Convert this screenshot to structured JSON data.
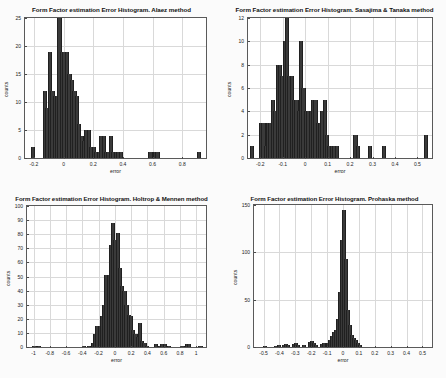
{
  "figure": {
    "background": "#fbfbfb",
    "bar_color": "#3a3a3a",
    "grid_color": "#d9d9d9",
    "axis_color": "#5a5a5a"
  },
  "chart_data": [
    {
      "type": "bar",
      "id": "alaez",
      "title": "Form Factor estimation Error Histogram. Alaez method",
      "xlabel": "error",
      "ylabel": "counts",
      "xlim": [
        -0.26,
        0.96
      ],
      "ylim": [
        0,
        25
      ],
      "xticks": [
        -0.2,
        0,
        0.2,
        0.4,
        0.6,
        0.8
      ],
      "xticklabels": [
        "-0.2",
        "0",
        "0.2",
        "0.4",
        "0.6",
        "0.8"
      ],
      "yticks": [
        0,
        5,
        10,
        15,
        20,
        25
      ],
      "yticklabels": [
        "0",
        "5",
        "10",
        "15",
        "20",
        "25"
      ],
      "grid": true,
      "bin_width": 0.0165,
      "bins": [
        {
          "x": -0.214,
          "v": 2
        },
        {
          "x": -0.131,
          "v": 12
        },
        {
          "x": -0.115,
          "v": 9
        },
        {
          "x": -0.098,
          "v": 19
        },
        {
          "x": -0.082,
          "v": 12
        },
        {
          "x": -0.065,
          "v": 11
        },
        {
          "x": -0.049,
          "v": 11
        },
        {
          "x": -0.033,
          "v": 25
        },
        {
          "x": -0.016,
          "v": 19
        },
        {
          "x": 0.0,
          "v": 19
        },
        {
          "x": 0.017,
          "v": 19
        },
        {
          "x": 0.033,
          "v": 15
        },
        {
          "x": 0.05,
          "v": 14
        },
        {
          "x": 0.066,
          "v": 12
        },
        {
          "x": 0.083,
          "v": 11
        },
        {
          "x": 0.099,
          "v": 6
        },
        {
          "x": 0.116,
          "v": 4
        },
        {
          "x": 0.132,
          "v": 3
        },
        {
          "x": 0.149,
          "v": 5
        },
        {
          "x": 0.165,
          "v": 5
        },
        {
          "x": 0.182,
          "v": 2
        },
        {
          "x": 0.198,
          "v": 2
        },
        {
          "x": 0.215,
          "v": 1
        },
        {
          "x": 0.231,
          "v": 1
        },
        {
          "x": 0.248,
          "v": 4
        },
        {
          "x": 0.264,
          "v": 4
        },
        {
          "x": 0.281,
          "v": 1
        },
        {
          "x": 0.297,
          "v": 1
        },
        {
          "x": 0.314,
          "v": 4
        },
        {
          "x": 0.33,
          "v": 1
        },
        {
          "x": 0.347,
          "v": 1
        },
        {
          "x": 0.363,
          "v": 1
        },
        {
          "x": 0.38,
          "v": 1
        },
        {
          "x": 0.578,
          "v": 1
        },
        {
          "x": 0.611,
          "v": 1
        },
        {
          "x": 0.627,
          "v": 1
        },
        {
          "x": 0.908,
          "v": 1
        }
      ]
    },
    {
      "type": "bar",
      "id": "sasajima-tanaka",
      "title": "Form Factor estimation Error Histogram. Sasajima & Tanaka method",
      "xlabel": "error",
      "ylabel": "counts",
      "xlim": [
        -0.255,
        0.565
      ],
      "ylim": [
        0,
        12
      ],
      "xticks": [
        -0.2,
        -0.1,
        0,
        0.1,
        0.2,
        0.3,
        0.4,
        0.5
      ],
      "xticklabels": [
        "-0.2",
        "-0.1",
        "0",
        "0.1",
        "0.2",
        "0.3",
        "0.4",
        "0.5"
      ],
      "yticks": [
        0,
        2,
        4,
        6,
        8,
        10,
        12
      ],
      "yticklabels": [
        "0",
        "2",
        "4",
        "6",
        "8",
        "10",
        "12"
      ],
      "grid": true,
      "bin_width": 0.0105,
      "bins": [
        {
          "x": -0.243,
          "v": 1
        },
        {
          "x": -0.201,
          "v": 3
        },
        {
          "x": -0.19,
          "v": 3
        },
        {
          "x": -0.18,
          "v": 1
        },
        {
          "x": -0.169,
          "v": 3
        },
        {
          "x": -0.159,
          "v": 3
        },
        {
          "x": -0.148,
          "v": 5
        },
        {
          "x": -0.138,
          "v": 4
        },
        {
          "x": -0.127,
          "v": 8
        },
        {
          "x": -0.117,
          "v": 8
        },
        {
          "x": -0.106,
          "v": 7
        },
        {
          "x": -0.096,
          "v": 10
        },
        {
          "x": -0.085,
          "v": 12
        },
        {
          "x": -0.075,
          "v": 7
        },
        {
          "x": -0.064,
          "v": 7
        },
        {
          "x": -0.054,
          "v": 5
        },
        {
          "x": -0.043,
          "v": 5
        },
        {
          "x": -0.033,
          "v": 4
        },
        {
          "x": -0.022,
          "v": 10
        },
        {
          "x": -0.012,
          "v": 6
        },
        {
          "x": -0.001,
          "v": 4
        },
        {
          "x": 0.009,
          "v": 4
        },
        {
          "x": 0.02,
          "v": 4
        },
        {
          "x": 0.031,
          "v": 5
        },
        {
          "x": 0.041,
          "v": 5
        },
        {
          "x": 0.052,
          "v": 3
        },
        {
          "x": 0.062,
          "v": 3
        },
        {
          "x": 0.073,
          "v": 4
        },
        {
          "x": 0.083,
          "v": 5
        },
        {
          "x": 0.094,
          "v": 2
        },
        {
          "x": 0.104,
          "v": 1
        },
        {
          "x": 0.115,
          "v": 1
        },
        {
          "x": 0.125,
          "v": 1
        },
        {
          "x": 0.136,
          "v": 1
        },
        {
          "x": 0.22,
          "v": 2
        },
        {
          "x": 0.231,
          "v": 1
        },
        {
          "x": 0.283,
          "v": 1
        },
        {
          "x": 0.346,
          "v": 1
        },
        {
          "x": 0.534,
          "v": 2
        }
      ]
    },
    {
      "type": "bar",
      "id": "holtrop-mennen",
      "title": "Form Factor estimation Error Histogram. Holtrop & Mennen method",
      "xlabel": "error",
      "ylabel": "counts",
      "xlim": [
        -1.08,
        1.12
      ],
      "ylim": [
        0,
        100
      ],
      "xticks": [
        -1,
        -0.8,
        -0.6,
        -0.4,
        -0.2,
        0,
        0.2,
        0.4,
        0.6,
        0.8,
        1
      ],
      "xticklabels": [
        "-1",
        "-0.8",
        "-0.6",
        "-0.4",
        "-0.2",
        "0",
        "0.2",
        "0.4",
        "0.6",
        "0.8",
        "1"
      ],
      "yticks": [
        0,
        10,
        20,
        30,
        40,
        50,
        60,
        70,
        80,
        90,
        100
      ],
      "yticklabels": [
        "0",
        "10",
        "20",
        "30",
        "40",
        "50",
        "60",
        "70",
        "80",
        "90",
        "100"
      ],
      "grid": true,
      "bin_width": 0.0275,
      "bins": [
        {
          "x": -1.0,
          "v": 1
        },
        {
          "x": -0.945,
          "v": 1
        },
        {
          "x": -0.39,
          "v": 1
        },
        {
          "x": -0.335,
          "v": 1
        },
        {
          "x": -0.28,
          "v": 3
        },
        {
          "x": -0.252,
          "v": 9
        },
        {
          "x": -0.225,
          "v": 15
        },
        {
          "x": -0.197,
          "v": 15
        },
        {
          "x": -0.17,
          "v": 22
        },
        {
          "x": -0.142,
          "v": 30
        },
        {
          "x": -0.115,
          "v": 51
        },
        {
          "x": -0.087,
          "v": 51
        },
        {
          "x": -0.06,
          "v": 72
        },
        {
          "x": -0.032,
          "v": 88
        },
        {
          "x": -0.005,
          "v": 76
        },
        {
          "x": 0.022,
          "v": 81
        },
        {
          "x": 0.05,
          "v": 56
        },
        {
          "x": 0.077,
          "v": 43
        },
        {
          "x": 0.105,
          "v": 40
        },
        {
          "x": 0.132,
          "v": 30
        },
        {
          "x": 0.16,
          "v": 23
        },
        {
          "x": 0.187,
          "v": 22
        },
        {
          "x": 0.215,
          "v": 12
        },
        {
          "x": 0.242,
          "v": 9
        },
        {
          "x": 0.27,
          "v": 7
        },
        {
          "x": 0.297,
          "v": 17
        },
        {
          "x": 0.325,
          "v": 4
        },
        {
          "x": 0.352,
          "v": 3
        },
        {
          "x": 0.38,
          "v": 1
        },
        {
          "x": 0.49,
          "v": 2
        },
        {
          "x": 0.545,
          "v": 1
        },
        {
          "x": 0.572,
          "v": 2
        },
        {
          "x": 0.6,
          "v": 2
        },
        {
          "x": 0.655,
          "v": 1
        },
        {
          "x": 0.82,
          "v": 1
        },
        {
          "x": 0.875,
          "v": 2
        },
        {
          "x": 0.902,
          "v": 2
        },
        {
          "x": 1.04,
          "v": 1
        }
      ]
    },
    {
      "type": "bar",
      "id": "prohaska",
      "title": "Form Factor estimation Error Histogram. Prohaska method",
      "xlabel": "error",
      "ylabel": "counts",
      "xlim": [
        -0.56,
        0.56
      ],
      "ylim": [
        0,
        150
      ],
      "xticks": [
        -0.5,
        -0.4,
        -0.3,
        -0.2,
        -0.1,
        0,
        0.1,
        0.2,
        0.3,
        0.4,
        0.5
      ],
      "xticklabels": [
        "-0.5",
        "-0.4",
        "-0.3",
        "-0.2",
        "-0.1",
        "0",
        "0.1",
        "0.2",
        "0.3",
        "0.4",
        "0.5"
      ],
      "yticks": [
        0,
        50,
        100,
        150
      ],
      "yticklabels": [
        "0",
        "50",
        "100",
        "150"
      ],
      "grid": true,
      "bin_width": 0.0125,
      "bins": [
        {
          "x": -0.5,
          "v": 1
        },
        {
          "x": -0.425,
          "v": 1
        },
        {
          "x": -0.412,
          "v": 2
        },
        {
          "x": -0.375,
          "v": 2
        },
        {
          "x": -0.362,
          "v": 3
        },
        {
          "x": -0.35,
          "v": 2
        },
        {
          "x": -0.312,
          "v": 3
        },
        {
          "x": -0.3,
          "v": 4
        },
        {
          "x": -0.288,
          "v": 2
        },
        {
          "x": -0.25,
          "v": 2
        },
        {
          "x": -0.212,
          "v": 5
        },
        {
          "x": -0.2,
          "v": 6
        },
        {
          "x": -0.188,
          "v": 4
        },
        {
          "x": -0.175,
          "v": 2
        },
        {
          "x": -0.138,
          "v": 3
        },
        {
          "x": -0.125,
          "v": 4
        },
        {
          "x": -0.1,
          "v": 4
        },
        {
          "x": -0.088,
          "v": 7
        },
        {
          "x": -0.075,
          "v": 12
        },
        {
          "x": -0.062,
          "v": 16
        },
        {
          "x": -0.05,
          "v": 18
        },
        {
          "x": -0.038,
          "v": 30
        },
        {
          "x": -0.025,
          "v": 58
        },
        {
          "x": -0.012,
          "v": 113
        },
        {
          "x": 0.0,
          "v": 145
        },
        {
          "x": 0.012,
          "v": 93
        },
        {
          "x": 0.025,
          "v": 39
        },
        {
          "x": 0.038,
          "v": 23
        },
        {
          "x": 0.05,
          "v": 13
        },
        {
          "x": 0.062,
          "v": 9
        },
        {
          "x": 0.075,
          "v": 7
        },
        {
          "x": 0.088,
          "v": 4
        },
        {
          "x": 0.1,
          "v": 2
        }
      ]
    }
  ]
}
